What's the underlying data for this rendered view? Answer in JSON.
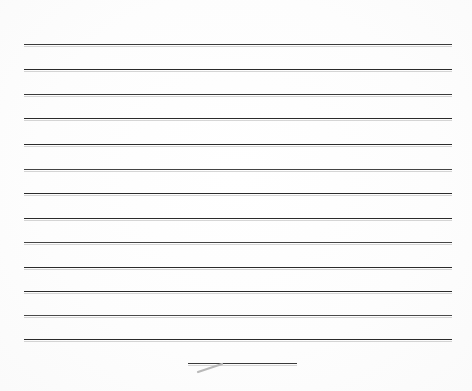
{
  "document": {
    "type": "scanned-lined-paper",
    "title": "Blank ruled notebook page",
    "description": "A scanned blank sheet of ruled writing paper with horizontal guide lines and no written text.",
    "page_width": 472,
    "page_height": 391,
    "background_color": "#fdfdfd",
    "line_color": "#2e2e2e",
    "line_shadow_color": "#8c8c8c",
    "written_text": "",
    "margin_top": 44,
    "margin_left": 24,
    "margin_right": 20,
    "line_count": 13,
    "line_spacing": 24.6
  },
  "ruled_lines": [
    {
      "id": "line-1",
      "y": 44,
      "x_start": 24,
      "x_end": 452,
      "thickness": 1.5,
      "color": "#3a3a3a"
    },
    {
      "id": "line-2",
      "y": 69,
      "x_start": 24,
      "x_end": 452,
      "thickness": 1.5,
      "color": "#2b2b2b"
    },
    {
      "id": "line-3",
      "y": 94,
      "x_start": 24,
      "x_end": 452,
      "thickness": 1.5,
      "color": "#3a3a3a"
    },
    {
      "id": "line-4",
      "y": 118,
      "x_start": 24,
      "x_end": 452,
      "thickness": 1.5,
      "color": "#2b2b2b"
    },
    {
      "id": "line-5",
      "y": 144,
      "x_start": 24,
      "x_end": 452,
      "thickness": 1.5,
      "color": "#2b2b2b"
    },
    {
      "id": "line-6",
      "y": 169,
      "x_start": 24,
      "x_end": 452,
      "thickness": 1.5,
      "color": "#444444"
    },
    {
      "id": "line-7",
      "y": 193,
      "x_start": 24,
      "x_end": 452,
      "thickness": 1.5,
      "color": "#2b2b2b"
    },
    {
      "id": "line-8",
      "y": 218,
      "x_start": 24,
      "x_end": 452,
      "thickness": 1.5,
      "color": "#2b2b2b"
    },
    {
      "id": "line-9",
      "y": 242,
      "x_start": 24,
      "x_end": 452,
      "thickness": 1.5,
      "color": "#444444"
    },
    {
      "id": "line-10",
      "y": 267,
      "x_start": 24,
      "x_end": 452,
      "thickness": 1.5,
      "color": "#2b2b2b"
    },
    {
      "id": "line-11",
      "y": 291,
      "x_start": 24,
      "x_end": 452,
      "thickness": 1.5,
      "color": "#2b2b2b"
    },
    {
      "id": "line-12",
      "y": 315,
      "x_start": 24,
      "x_end": 452,
      "thickness": 1.5,
      "color": "#4a4a4a"
    },
    {
      "id": "line-13",
      "y": 339,
      "x_start": 24,
      "x_end": 452,
      "thickness": 1.5,
      "color": "#2b2b2b"
    }
  ],
  "short_rule": {
    "id": "signature-rule",
    "label": "short underline near bottom center",
    "y": 363,
    "x_start": 188,
    "x_end": 297,
    "thickness": 1.6,
    "color": "#3a3a3a"
  },
  "pencil_mark": {
    "id": "stray-pencil-stroke",
    "label": "faint diagonal pencil stroke below short rule",
    "x_start": 198,
    "y_start": 372,
    "x_end": 222,
    "y_end": 364,
    "color": "#b9b9b9"
  }
}
